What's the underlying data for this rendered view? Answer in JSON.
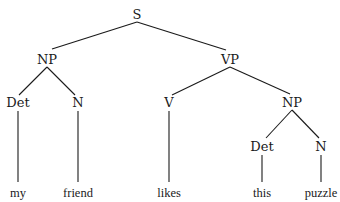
{
  "diagram": {
    "type": "syntax-tree",
    "sentence": "my friend likes this puzzle",
    "line_color": "#1a1a1a",
    "text_color": "#1a1a1a",
    "nodes": [
      {
        "id": "s",
        "label": "S",
        "kind": "cat",
        "x": 137,
        "y": 14
      },
      {
        "id": "np1",
        "label": "NP",
        "kind": "cat",
        "x": 47,
        "y": 59
      },
      {
        "id": "vp",
        "label": "VP",
        "kind": "cat",
        "x": 230,
        "y": 59
      },
      {
        "id": "det1",
        "label": "Det",
        "kind": "cat",
        "x": 18,
        "y": 102
      },
      {
        "id": "n1",
        "label": "N",
        "kind": "cat",
        "x": 78,
        "y": 102
      },
      {
        "id": "v",
        "label": "V",
        "kind": "cat",
        "x": 169,
        "y": 102
      },
      {
        "id": "np2",
        "label": "NP",
        "kind": "cat",
        "x": 292,
        "y": 102
      },
      {
        "id": "det2",
        "label": "Det",
        "kind": "cat",
        "x": 262,
        "y": 146
      },
      {
        "id": "n2",
        "label": "N",
        "kind": "cat",
        "x": 321,
        "y": 146
      },
      {
        "id": "w_my",
        "label": "my",
        "kind": "word",
        "x": 18,
        "y": 193
      },
      {
        "id": "w_friend",
        "label": "friend",
        "kind": "word",
        "x": 78,
        "y": 193
      },
      {
        "id": "w_likes",
        "label": "likes",
        "kind": "word",
        "x": 169,
        "y": 193
      },
      {
        "id": "w_this",
        "label": "this",
        "kind": "word",
        "x": 262,
        "y": 193
      },
      {
        "id": "w_puzzle",
        "label": "puzzle",
        "kind": "word",
        "x": 321,
        "y": 193
      }
    ],
    "edges": [
      {
        "from": "s",
        "to": "np1",
        "x1": 137,
        "y1": 22,
        "x2": 52,
        "y2": 49
      },
      {
        "from": "s",
        "to": "vp",
        "x1": 137,
        "y1": 22,
        "x2": 226,
        "y2": 50
      },
      {
        "from": "np1",
        "to": "det1",
        "x1": 47,
        "y1": 67,
        "x2": 19,
        "y2": 95
      },
      {
        "from": "np1",
        "to": "n1",
        "x1": 47,
        "y1": 67,
        "x2": 75,
        "y2": 95
      },
      {
        "from": "vp",
        "to": "v",
        "x1": 230,
        "y1": 67,
        "x2": 172,
        "y2": 95
      },
      {
        "from": "vp",
        "to": "np2",
        "x1": 230,
        "y1": 67,
        "x2": 290,
        "y2": 94
      },
      {
        "from": "np2",
        "to": "det2",
        "x1": 292,
        "y1": 110,
        "x2": 266,
        "y2": 138
      },
      {
        "from": "np2",
        "to": "n2",
        "x1": 292,
        "y1": 110,
        "x2": 319,
        "y2": 138
      },
      {
        "from": "det1",
        "to": "w_my",
        "x1": 18,
        "y1": 111,
        "x2": 18,
        "y2": 182
      },
      {
        "from": "n1",
        "to": "w_friend",
        "x1": 78,
        "y1": 111,
        "x2": 78,
        "y2": 182
      },
      {
        "from": "v",
        "to": "w_likes",
        "x1": 169,
        "y1": 111,
        "x2": 169,
        "y2": 182
      },
      {
        "from": "det2",
        "to": "w_this",
        "x1": 262,
        "y1": 155,
        "x2": 262,
        "y2": 182
      },
      {
        "from": "n2",
        "to": "w_puzzle",
        "x1": 321,
        "y1": 155,
        "x2": 321,
        "y2": 182
      }
    ]
  }
}
